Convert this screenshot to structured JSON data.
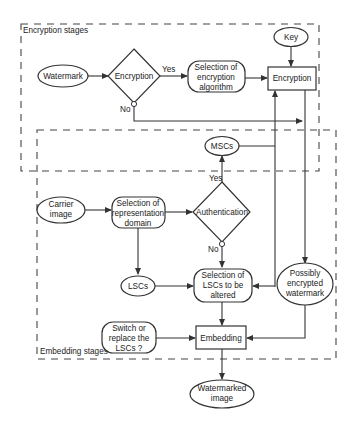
{
  "diagram": {
    "groups": {
      "encryption": {
        "label": "Encryption stages"
      },
      "embedding": {
        "label": "Embedding stages"
      }
    },
    "nodes": {
      "watermark": {
        "label": "Watermark",
        "shape": "ellipse"
      },
      "encryption_decision": {
        "label": "Encryption",
        "shape": "diamond"
      },
      "selection_algorithm": {
        "lines": [
          "Selection of",
          "encryption",
          "algorithm"
        ],
        "shape": "rounded-rect"
      },
      "key": {
        "label": "Key",
        "shape": "ellipse"
      },
      "encryption_process": {
        "label": "Encryption",
        "shape": "rect"
      },
      "mscs": {
        "label": "MSCs",
        "shape": "ellipse"
      },
      "carrier_image": {
        "lines": [
          "Carrier",
          "image"
        ],
        "shape": "ellipse"
      },
      "selection_domain": {
        "lines": [
          "Selection of",
          "representation",
          "domain"
        ],
        "shape": "rounded-rect"
      },
      "authentication": {
        "label": "Authentication",
        "shape": "diamond"
      },
      "lscs": {
        "label": "LSCs",
        "shape": "ellipse"
      },
      "selection_lscs": {
        "lines": [
          "Selection of",
          "LSCs to be",
          "altered"
        ],
        "shape": "rounded-rect"
      },
      "possibly_encrypted": {
        "lines": [
          "Possibly",
          "encrypted",
          "watermark"
        ],
        "shape": "ellipse"
      },
      "switch_replace": {
        "lines": [
          "Switch or",
          "replace the",
          "LSCs ?"
        ],
        "shape": "rounded-rect"
      },
      "embedding_process": {
        "label": "Embedding",
        "shape": "rect"
      },
      "watermarked_image": {
        "lines": [
          "Watermarked",
          "image"
        ],
        "shape": "ellipse"
      }
    },
    "edge_labels": {
      "encryption_yes": "Yes",
      "encryption_no": "No",
      "authentication_yes": "Yes",
      "authentication_no": "No"
    },
    "edges": [
      {
        "from": "watermark",
        "to": "encryption_decision"
      },
      {
        "from": "encryption_decision",
        "to": "selection_algorithm",
        "label": "Yes"
      },
      {
        "from": "selection_algorithm",
        "to": "encryption_process"
      },
      {
        "from": "key",
        "to": "encryption_process"
      },
      {
        "from": "encryption_decision",
        "to": "possibly_encrypted",
        "label": "No"
      },
      {
        "from": "encryption_process",
        "to": "possibly_encrypted"
      },
      {
        "from": "mscs",
        "to": "encryption_process"
      },
      {
        "from": "carrier_image",
        "to": "selection_domain"
      },
      {
        "from": "selection_domain",
        "to": "authentication"
      },
      {
        "from": "authentication",
        "to": "mscs",
        "label": "Yes"
      },
      {
        "from": "authentication",
        "to": "selection_lscs",
        "label": "No"
      },
      {
        "from": "selection_domain",
        "to": "lscs"
      },
      {
        "from": "lscs",
        "to": "selection_lscs"
      },
      {
        "from": "mscs",
        "to": "selection_lscs"
      },
      {
        "from": "selection_lscs",
        "to": "embedding_process"
      },
      {
        "from": "possibly_encrypted",
        "to": "embedding_process"
      },
      {
        "from": "switch_replace",
        "to": "embedding_process"
      },
      {
        "from": "embedding_process",
        "to": "watermarked_image"
      }
    ]
  }
}
